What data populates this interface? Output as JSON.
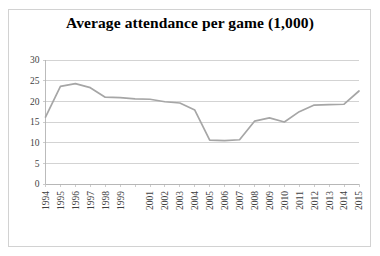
{
  "chart_data": {
    "type": "line",
    "title": "Average attendance per game (1,000)",
    "xlabel": "",
    "ylabel": "",
    "ylim": [
      0,
      30
    ],
    "yticks": [
      0,
      5,
      10,
      15,
      20,
      25,
      30
    ],
    "grid": true,
    "legend": false,
    "legend_position": "none",
    "series_color": "#a6a6a6",
    "x": [
      1994,
      1995,
      1996,
      1997,
      1998,
      1999,
      2000,
      2001,
      2002,
      2003,
      2004,
      2005,
      2006,
      2007,
      2008,
      2009,
      2010,
      2011,
      2012,
      2013,
      2014,
      2015
    ],
    "xtick_labels": [
      "1994",
      "1995",
      "1996",
      "1997",
      "1998",
      "1999",
      "2001",
      "2002",
      "2003",
      "2004",
      "2005",
      "2006",
      "2007",
      "2008",
      "2009",
      "2010",
      "2011",
      "2012",
      "2013",
      "2014",
      "2015"
    ],
    "categories": [
      "1994",
      "1995",
      "1996",
      "1997",
      "1998",
      "1999",
      "2000",
      "2001",
      "2002",
      "2003",
      "2004",
      "2005",
      "2006",
      "2007",
      "2008",
      "2009",
      "2010",
      "2011",
      "2012",
      "2013",
      "2014",
      "2015"
    ],
    "values": [
      16.2,
      23.6,
      24.3,
      23.3,
      21.0,
      20.9,
      20.6,
      20.5,
      19.9,
      19.6,
      17.9,
      10.6,
      10.5,
      10.7,
      15.2,
      16.0,
      15.0,
      17.5,
      19.1,
      19.2,
      19.3,
      22.5
    ],
    "series": [
      {
        "name": "Average attendance per game (1,000)",
        "values": [
          16.2,
          23.6,
          24.3,
          23.3,
          21.0,
          20.9,
          20.6,
          20.5,
          19.9,
          19.6,
          17.9,
          10.6,
          10.5,
          10.7,
          15.2,
          16.0,
          15.0,
          17.5,
          19.1,
          19.2,
          19.3,
          22.5
        ]
      }
    ]
  }
}
